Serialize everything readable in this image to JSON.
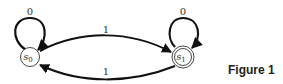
{
  "diagram": {
    "type": "finite-state-automaton",
    "states": [
      {
        "id": "s0",
        "label": "s",
        "subscript": "0",
        "accepting": false
      },
      {
        "id": "s1",
        "label": "s",
        "subscript": "1",
        "accepting": true
      }
    ],
    "transitions": [
      {
        "from": "s0",
        "to": "s0",
        "label": "0"
      },
      {
        "from": "s1",
        "to": "s1",
        "label": "0"
      },
      {
        "from": "s0",
        "to": "s1",
        "label": "1"
      },
      {
        "from": "s1",
        "to": "s0",
        "label": "1"
      }
    ],
    "colors": {
      "stroke": "#111111",
      "background": "#ffffff"
    }
  },
  "caption": "Figure 1"
}
